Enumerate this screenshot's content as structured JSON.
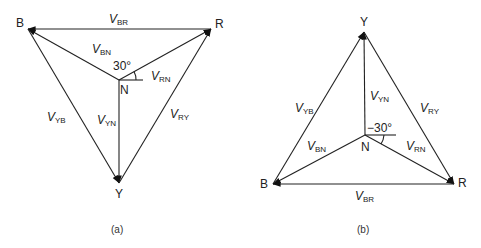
{
  "figure": {
    "panels": [
      {
        "caption": "(a)",
        "nodes": {
          "B": {
            "label": "B",
            "x": 28,
            "y": 29
          },
          "R": {
            "label": "R",
            "x": 211,
            "y": 29
          },
          "Y": {
            "label": "Y",
            "x": 119,
            "y": 183
          },
          "N": {
            "label": "N",
            "x": 119,
            "y": 80
          }
        },
        "angle_label": "30°",
        "vectors": [
          {
            "name": "V",
            "sub": "BR",
            "from": "R",
            "to": "B"
          },
          {
            "name": "V",
            "sub": "BN",
            "from": "N",
            "to": "B"
          },
          {
            "name": "V",
            "sub": "RN",
            "from": "N",
            "to": "R"
          },
          {
            "name": "V",
            "sub": "YN",
            "from": "N",
            "to": "Y"
          },
          {
            "name": "V",
            "sub": "YB",
            "from": "B",
            "to": "Y"
          },
          {
            "name": "V",
            "sub": "RY",
            "from": "Y",
            "to": "R"
          }
        ]
      },
      {
        "caption": "(b)",
        "nodes": {
          "Y": {
            "label": "Y",
            "x": 364,
            "y": 32
          },
          "B": {
            "label": "B",
            "x": 273,
            "y": 184
          },
          "R": {
            "label": "R",
            "x": 454,
            "y": 184
          },
          "N": {
            "label": "N",
            "x": 365,
            "y": 135
          }
        },
        "angle_label": "−30°",
        "vectors": [
          {
            "name": "V",
            "sub": "YB",
            "from": "B",
            "to": "Y"
          },
          {
            "name": "V",
            "sub": "YN",
            "from": "N",
            "to": "Y"
          },
          {
            "name": "V",
            "sub": "RY",
            "from": "Y",
            "to": "R"
          },
          {
            "name": "V",
            "sub": "BN",
            "from": "N",
            "to": "B"
          },
          {
            "name": "V",
            "sub": "RN",
            "from": "N",
            "to": "R"
          },
          {
            "name": "V",
            "sub": "BR",
            "from": "R",
            "to": "B"
          }
        ]
      }
    ]
  },
  "labels": {
    "a": {
      "B": "B",
      "R": "R",
      "Y": "Y",
      "N": "N",
      "angle": "30°",
      "caption": "(a)",
      "V": "V",
      "BR": "BR",
      "BN": "BN",
      "RN": "RN",
      "YN": "YN",
      "YB": "YB",
      "RY": "RY"
    },
    "b": {
      "B": "B",
      "R": "R",
      "Y": "Y",
      "N": "N",
      "angle": "−30°",
      "caption": "(b)",
      "V": "V",
      "BR": "BR",
      "BN": "BN",
      "RN": "RN",
      "YN": "YN",
      "YB": "YB",
      "RY": "RY"
    }
  }
}
